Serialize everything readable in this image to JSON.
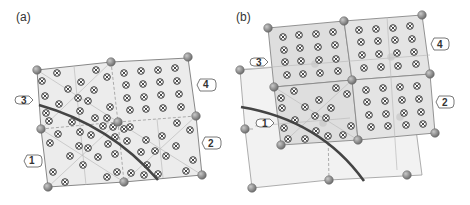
{
  "panels": {
    "a": {
      "label": "(a)",
      "region_labels": [
        "1",
        "2",
        "3",
        "4"
      ]
    },
    "b": {
      "label": "(b)",
      "region_labels": [
        "1",
        "2",
        "3",
        "4"
      ]
    }
  },
  "colors": {
    "cell_fill": "#e8e8e8",
    "cell_fill_dark": "#dcdcdc",
    "cell_fill_light": "#f0f0f0",
    "edge": "#888888",
    "node": "#8a8a8a",
    "curve": "#444444",
    "marker": "#333333"
  }
}
